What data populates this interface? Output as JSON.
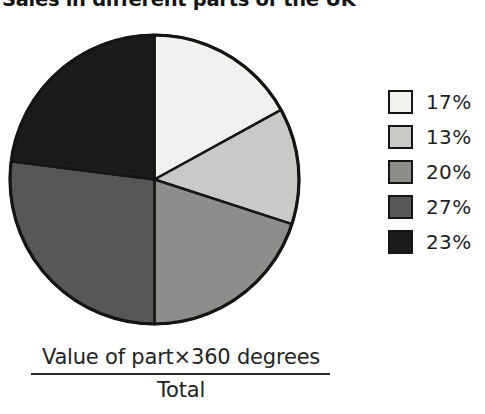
{
  "title": "Sales in different parts of the UK",
  "formula": {
    "numerator": "Value of part×360 degrees",
    "denominator": "Total"
  },
  "legend": {
    "items": [
      {
        "label": "17%",
        "color": "#f1f1ef"
      },
      {
        "label": "13%",
        "color": "#c9c9c7"
      },
      {
        "label": "20%",
        "color": "#8d8d8b"
      },
      {
        "label": "27%",
        "color": "#575757"
      },
      {
        "label": "23%",
        "color": "#1b1b1b"
      }
    ]
  },
  "chart_data": {
    "type": "pie",
    "title": "Sales in different parts of the UK",
    "categories": [
      "17%",
      "13%",
      "20%",
      "27%",
      "23%"
    ],
    "values": [
      17,
      13,
      20,
      27,
      23
    ],
    "unit": "percent",
    "total": 100,
    "start_angle_deg": 0,
    "direction": "clockwise",
    "colors": [
      "#f1f1ef",
      "#c9c9c7",
      "#8d8d8b",
      "#575757",
      "#1b1b1b"
    ],
    "slice_border_color": "#151515",
    "legend_position": "right",
    "grid": false,
    "xlabel": "",
    "ylabel": "",
    "annotation": "Value of part×360 degrees / Total"
  }
}
